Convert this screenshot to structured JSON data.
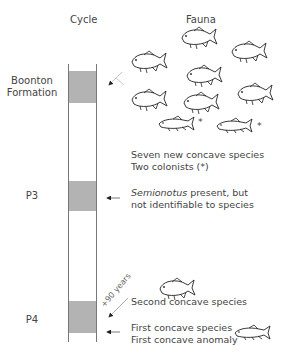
{
  "headers": {
    "cycle": "Cycle",
    "fauna": "Fauna"
  },
  "cycles": [
    {
      "label_line1": "Boonton",
      "label_line2": "Formation"
    },
    {
      "label_line1": "P3",
      "label_line2": ""
    },
    {
      "label_line1": "P4",
      "label_line2": ""
    }
  ],
  "notes": {
    "boonton_line1": "Seven new concave species",
    "boonton_line2": "Two colonists (*)",
    "p3_line1_italic": "Semionotus",
    "p3_line1_rest": " present, but",
    "p3_line2": "not identifiable to species",
    "p4_second": "Second concave species",
    "p4_first_line1": "First concave species",
    "p4_first_line2": "First concave anomaly",
    "interval": "+90 years"
  },
  "markers": {
    "colonist": "*"
  },
  "colors": {
    "band": "#b3b3b3",
    "column_line": "#777777",
    "text": "#444444"
  }
}
